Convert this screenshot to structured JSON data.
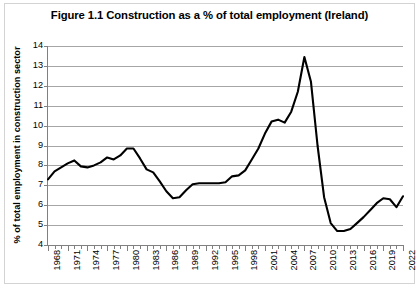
{
  "chart_data": {
    "type": "line",
    "title": "Figure 1.1 Construction as a % of total employment (Ireland)",
    "xlabel": "",
    "ylabel": "% of total employment in construction sector",
    "ylim": [
      4,
      14
    ],
    "yticks": [
      4,
      5,
      6,
      7,
      8,
      9,
      10,
      11,
      12,
      13,
      14
    ],
    "xlim": [
      1968,
      2022
    ],
    "xtick_labels": [
      "1968",
      "1971",
      "1974",
      "1977",
      "1980",
      "1983",
      "1986",
      "1989",
      "1992",
      "1995",
      "1998",
      "2001",
      "2004",
      "2007",
      "2010",
      "2013",
      "2016",
      "2019",
      "2022"
    ],
    "xtick_step": 3,
    "minor_xticks_every_year": true,
    "grid": "horizontal",
    "legend": "none",
    "line_color": "#000000",
    "grid_color": "#a6a6a6",
    "background_color": "#ffffff",
    "border_color": "#d3d3d3",
    "x": [
      1968,
      1969,
      1970,
      1971,
      1972,
      1973,
      1974,
      1975,
      1976,
      1977,
      1978,
      1979,
      1980,
      1981,
      1982,
      1983,
      1984,
      1985,
      1986,
      1987,
      1988,
      1989,
      1990,
      1991,
      1992,
      1993,
      1994,
      1995,
      1996,
      1997,
      1998,
      1999,
      2000,
      2001,
      2002,
      2003,
      2004,
      2005,
      2006,
      2007,
      2008,
      2009,
      2010,
      2011,
      2012,
      2013,
      2014,
      2015,
      2016,
      2017,
      2018,
      2019,
      2020,
      2021,
      2022
    ],
    "values": [
      7.3,
      7.7,
      7.9,
      8.1,
      8.25,
      7.95,
      7.9,
      8.0,
      8.15,
      8.4,
      8.3,
      8.5,
      8.85,
      8.85,
      8.35,
      7.8,
      7.65,
      7.2,
      6.7,
      6.35,
      6.4,
      6.75,
      7.05,
      7.1,
      7.1,
      7.1,
      7.1,
      7.15,
      7.45,
      7.5,
      7.75,
      8.3,
      8.85,
      9.6,
      10.2,
      10.3,
      10.15,
      10.7,
      11.7,
      13.45,
      12.2,
      9.0,
      6.4,
      5.1,
      4.7,
      4.7,
      4.8,
      5.1,
      5.4,
      5.75,
      6.1,
      6.35,
      6.3,
      5.9,
      6.45
    ],
    "annotations": {
      "peak": {
        "year": 2007,
        "value": 13.45
      },
      "trough": {
        "year": 2012,
        "value": 4.7
      }
    }
  }
}
